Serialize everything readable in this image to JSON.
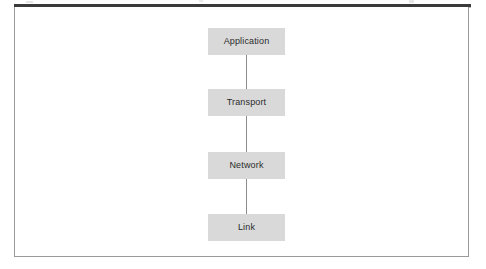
{
  "figure": {
    "background_color": "#ffffff",
    "frame_border_color": "#9a9a9a",
    "top_rule_color": "#3a3a3a",
    "box_fill_color": "#d9d9d9",
    "box_text_color": "#2b2b2b",
    "connector_color": "#8c8c8c"
  },
  "diagram": {
    "type": "vertical-stack",
    "orientation": "top-to-bottom",
    "layers": [
      {
        "label": "Application",
        "index": 1
      },
      {
        "label": "Transport",
        "index": 2
      },
      {
        "label": "Network",
        "index": 3
      },
      {
        "label": "Link",
        "index": 4
      }
    ],
    "connectors": [
      {
        "from": "Application",
        "to": "Transport"
      },
      {
        "from": "Transport",
        "to": "Network"
      },
      {
        "from": "Network",
        "to": "Link"
      }
    ]
  }
}
